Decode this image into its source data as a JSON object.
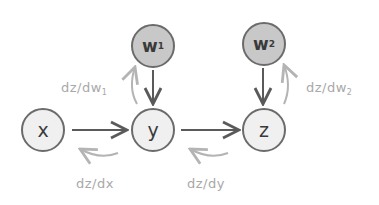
{
  "nodes": {
    "w1": {
      "label": "w",
      "sub": "1"
    },
    "w2": {
      "label": "w",
      "sub": "2"
    },
    "x": {
      "label": "x"
    },
    "y": {
      "label": "y"
    },
    "z": {
      "label": "z"
    }
  },
  "gradients": {
    "dw1": {
      "label": "dz/dw",
      "sub": "1"
    },
    "dw2": {
      "label": "dz/dw",
      "sub": "2"
    },
    "dx": {
      "label": "dz/dx"
    },
    "dy": {
      "label": "dz/dy"
    }
  },
  "colors": {
    "forward_arrow": "#5a5a5a",
    "backward_arrow": "#b4b4b4",
    "param_fill": "#c8c8c8",
    "var_fill": "#f0f0f0"
  }
}
